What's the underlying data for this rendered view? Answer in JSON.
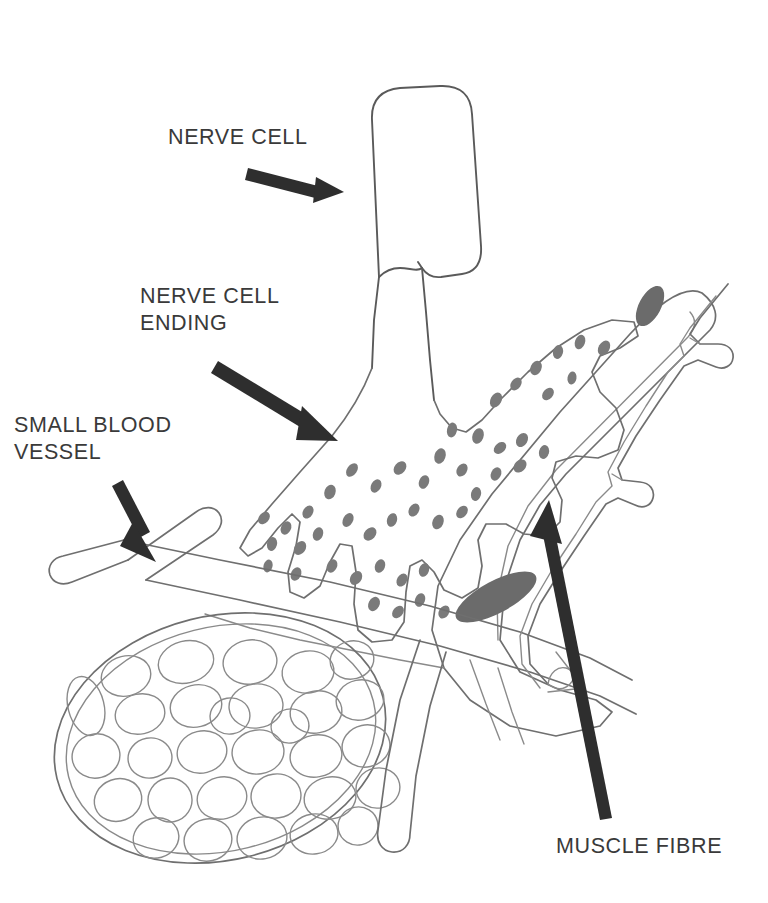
{
  "figure": {
    "background_color": "#ffffff",
    "ink_color": "#6f6f6f",
    "label_color": "#3a3a3a",
    "arrow_color": "#2e2e2e",
    "vesicle_color": "#7a7a7a",
    "nucleus_color": "#6b6b6b",
    "width": 768,
    "height": 903
  },
  "labels": [
    {
      "id": "nerve-cell",
      "text": "NERVE CELL",
      "lines": [
        "NERVE CELL"
      ],
      "x": 168,
      "y": 144,
      "anchor": "start",
      "arrow": {
        "from": [
          248,
          172
        ],
        "to": [
          340,
          196
        ]
      }
    },
    {
      "id": "nerve-cell-ending",
      "text": "NERVE CELL ENDING",
      "lines": [
        "NERVE CELL",
        "ENDING"
      ],
      "x": 140,
      "y": 303,
      "anchor": "start",
      "arrow": {
        "from": [
          218,
          366
        ],
        "to": [
          333,
          437
        ]
      }
    },
    {
      "id": "small-blood-vessel",
      "text": "SMALL BLOOD VESSEL",
      "lines": [
        "SMALL BLOOD",
        "VESSEL"
      ],
      "x": 60,
      "y": 432,
      "anchor": "start",
      "arrow": {
        "from": [
          124,
          483
        ],
        "to": [
          153,
          555
        ]
      }
    },
    {
      "id": "muscle-fibre",
      "text": "MUSCLE FIBRE",
      "lines": [
        "MUSCLE FIBRE"
      ],
      "x": 560,
      "y": 846,
      "anchor": "start",
      "arrow": {
        "from": [
          609,
          816
        ],
        "to": [
          548,
          505
        ]
      }
    }
  ],
  "structures": [
    {
      "id": "nerve-cell-body",
      "name": "Nerve cell axon trunk",
      "description": "Rounded rectangular column descending from the top of the figure, narrowing into a short axon neck."
    },
    {
      "id": "nerve-cell-ending",
      "name": "Nerve cell ending",
      "description": "Flared terminal with finger-like lobes containing scattered dark synaptic vesicles."
    },
    {
      "id": "muscle-fibre",
      "name": "Muscle fibre",
      "description": "Large elongated fibre running diagonally from lower-left to upper-right with two dark nuclei."
    },
    {
      "id": "muscle-fibre-cut-end",
      "name": "Muscle fibre cut end",
      "description": "Oval cross-section at lower left showing packed myofibrils inside a double sheath."
    },
    {
      "id": "small-blood-vessel",
      "name": "Small blood vessel",
      "description": "Branching capillary network crossing the field with rounded open cut ends."
    },
    {
      "id": "capillary-alongside",
      "name": "Capillary alongside fibre",
      "description": "Narrow vessel running parallel to the muscle fibre with small knobbed side branches."
    }
  ],
  "counts": {
    "myofibrils_in_cut_end": 41,
    "synaptic_vesicles": 46,
    "muscle_nuclei": 2
  }
}
